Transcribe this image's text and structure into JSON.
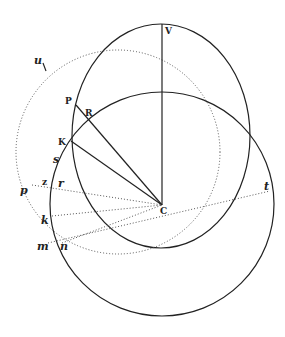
{
  "figure": {
    "title": "",
    "points": {
      "V": {
        "x": 162,
        "y": 24
      },
      "C": {
        "x": 162,
        "y": 205
      },
      "P": {
        "x": 76,
        "y": 105
      },
      "R": {
        "x": 93,
        "y": 116
      },
      "K": {
        "x": 72,
        "y": 142
      },
      "s": {
        "x": 60,
        "y": 160
      },
      "z": {
        "x": 46,
        "y": 187
      },
      "r": {
        "x": 60,
        "y": 187
      },
      "p": {
        "x": 24,
        "y": 186
      },
      "k": {
        "x": 50,
        "y": 216
      },
      "m": {
        "x": 48,
        "y": 245
      },
      "n": {
        "x": 64,
        "y": 243
      },
      "t": {
        "x": 270,
        "y": 191
      },
      "u": {
        "x": 43,
        "y": 65
      }
    },
    "labels": {
      "V": "V",
      "C": "C",
      "P": "P",
      "R": "R",
      "K": "K",
      "s": "s",
      "z": "z",
      "r": "r",
      "p": "p",
      "k": "k",
      "m": "m",
      "n": "n",
      "t": "t",
      "u": "u"
    },
    "shapes": {
      "ellipse": {
        "cx": 161,
        "cy": 136,
        "rx": 89,
        "ry": 112,
        "style": "solid"
      },
      "large_circle": {
        "cx": 162,
        "cy": 204,
        "r": 112,
        "style": "solid"
      },
      "dotted_circle": {
        "cx": 118,
        "cy": 152,
        "r": 102,
        "style": "dotted"
      }
    },
    "colors": {
      "stroke": "#222222",
      "dotted": "#555555",
      "background": "#ffffff"
    }
  }
}
